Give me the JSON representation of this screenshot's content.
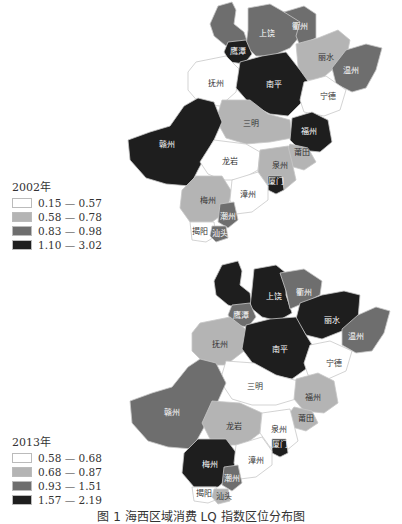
{
  "colors": {
    "class1": "#ffffff",
    "class2": "#b4b4b4",
    "class3": "#6e6e6e",
    "class4": "#1e1e1e"
  },
  "maps": [
    {
      "year_label": "2002年",
      "legend": [
        {
          "range": "0.15 — 0.57",
          "class": 1
        },
        {
          "range": "0.58 — 0.78",
          "class": 2
        },
        {
          "range": "0.83 — 0.98",
          "class": 3
        },
        {
          "range": "1.10 — 3.02",
          "class": 4
        }
      ],
      "regions": {
        "景德镇": 3,
        "上饶": 3,
        "衢州": 3,
        "鹰潭": 4,
        "丽水": 2,
        "温州": 3,
        "抚州": 1,
        "南平": 4,
        "宁德": 1,
        "三明": 2,
        "福州": 4,
        "赣州": 4,
        "龙岩": 1,
        "莆田": 2,
        "泉州": 2,
        "厦门": 4,
        "梅州": 2,
        "漳州": 1,
        "潮州": 3,
        "揭阳": 1,
        "汕头": 3
      }
    },
    {
      "year_label": "2013年",
      "legend": [
        {
          "range": "0.58 — 0.68",
          "class": 1
        },
        {
          "range": "0.68 — 0.87",
          "class": 2
        },
        {
          "range": "0.93 — 1.51",
          "class": 3
        },
        {
          "range": "1.57 — 2.19",
          "class": 4
        }
      ],
      "regions": {
        "景德镇": 4,
        "上饶": 4,
        "衢州": 3,
        "鹰潭": 3,
        "丽水": 4,
        "温州": 3,
        "抚州": 2,
        "南平": 4,
        "宁德": 1,
        "三明": 1,
        "福州": 2,
        "赣州": 3,
        "龙岩": 2,
        "莆田": 2,
        "泉州": 1,
        "厦门": 4,
        "梅州": 4,
        "漳州": 1,
        "潮州": 3,
        "揭阳": 1,
        "汕头": 2
      }
    }
  ],
  "region_labels": {
    "上饶": "上饶",
    "衢州": "衢州",
    "鹰潭": "鹰潭",
    "丽水": "丽水",
    "温州": "温州",
    "抚州": "抚州",
    "南平": "南平",
    "宁德": "宁德",
    "三明": "三明",
    "福州": "福州",
    "赣州": "赣州",
    "龙岩": "龙岩",
    "莆田": "莆田",
    "泉州": "泉州",
    "厦门": "厦门",
    "梅州": "梅州",
    "漳州": "漳州",
    "潮州": "潮州",
    "揭阳": "揭阳",
    "汕头": "汕头"
  },
  "caption": "图 1  海西区域消费 LQ 指数区位分布图"
}
